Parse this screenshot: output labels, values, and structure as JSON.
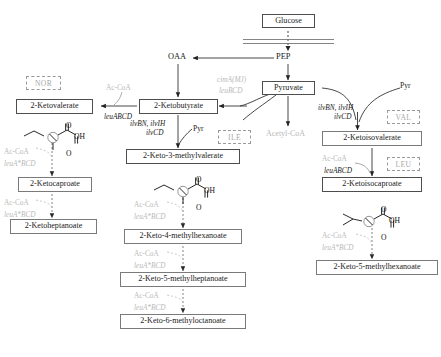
{
  "diagram": {
    "membrane": {
      "name": "cell-membrane"
    },
    "nodes": {
      "glucose": "Glucose",
      "pep": "PEP",
      "oaa": "OAA",
      "pyruvate": "Pyruvate",
      "acetyl_coa": "Acetyl-CoA",
      "ketobutyrate": "2-Ketobutyrate",
      "ketovalerate": "2-Ketovalerate",
      "ketocaproate": "2-Ketocaproate",
      "ketoheptanoate": "2-Ketoheptanoate",
      "keto3methylvalerate": "2-Keto-3-methylvalerate",
      "keto4methylhexanoate": "2-Keto-4-methylhexanoate",
      "keto5methylheptanoate": "2-Keto-5-methylheptanoate",
      "keto6methyloctanoate": "2-Keto-6-methyloctanoate",
      "ketoisovalerate": "2-Ketoisovalerate",
      "ketoisocaproate": "2-Ketoisocaproate",
      "keto5methylhexanoate": "2-Keto-5-methylhexanoate"
    },
    "amino_acids": {
      "nor": "NOR",
      "ile": "ILE",
      "val": "VAL",
      "leu": "LEU"
    },
    "enzymes": {
      "leuABCD_1": "leuABCD",
      "leuABCD_2": "leuABCD",
      "leuA_BCD": "leuA*BCD",
      "ilvBN_ilvIH": "ilvBN, ilvIH",
      "ilvCD": "ilvCD",
      "cimA_MJ": "cimA(MJ)",
      "leuBCD": "leuBCD"
    },
    "cofactors": {
      "ac_coa": "Ac-CoA",
      "pyr": "Pyr"
    },
    "structures": {
      "oh": "OH",
      "o": "O"
    },
    "colors": {
      "box_stroke": "#7a7a7a",
      "gray_label": "#b9b9b9",
      "arrow": "#333333",
      "dashed_box": "#9a9a9a"
    }
  }
}
